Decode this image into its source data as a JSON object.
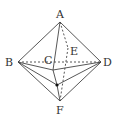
{
  "diagram": {
    "type": "octahedron-like solid",
    "labels": {
      "A": "A",
      "B": "B",
      "C": "C",
      "D": "D",
      "E": "E",
      "F": "F"
    },
    "colors": {
      "line": "#444444",
      "background": "#ffffff"
    }
  }
}
